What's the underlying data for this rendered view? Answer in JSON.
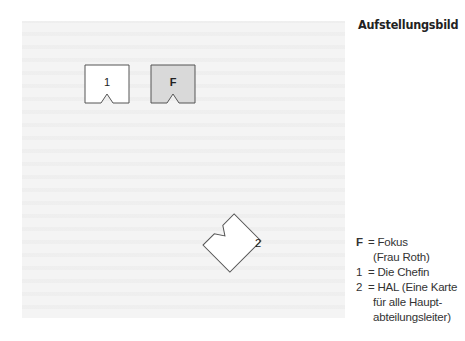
{
  "diagram": {
    "title": "Aufstellungsbild",
    "field_color": "#f4f4f4",
    "cards": [
      {
        "id": "1",
        "label": "1",
        "fill": "#ffffff",
        "rotation_deg": 0
      },
      {
        "id": "F",
        "label": "F",
        "fill": "#d9d9d9",
        "rotation_deg": 0,
        "bold": true
      },
      {
        "id": "2",
        "label": "2",
        "fill": "#ffffff",
        "rotation_deg": -45
      }
    ],
    "legend": [
      {
        "key": "F",
        "sep": " = ",
        "lines": [
          "Fokus",
          "(Frau Roth)"
        ]
      },
      {
        "key": "1",
        "sep": " = ",
        "lines": [
          "Die Chefin"
        ]
      },
      {
        "key": "2",
        "sep": " = ",
        "lines": [
          "HAL (Eine Karte",
          "für alle Haupt-",
          "abteilungsleiter)"
        ]
      }
    ]
  }
}
